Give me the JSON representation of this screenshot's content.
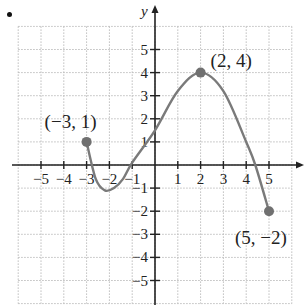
{
  "chart_data": {
    "type": "line",
    "title": "",
    "xlabel": "",
    "ylabel": "y",
    "xlim": [
      -6,
      6
    ],
    "ylim": [
      -6,
      6
    ],
    "grid": true,
    "x_ticks": [
      -5,
      -4,
      -3,
      -2,
      -1,
      1,
      2,
      3,
      4,
      5
    ],
    "x_tick_labels": [
      "−5",
      "−4",
      "−3",
      "−2",
      "−1",
      "1",
      "2",
      "3",
      "4",
      "5"
    ],
    "y_ticks": [
      5,
      4,
      3,
      2,
      1,
      -1,
      -2,
      -3,
      -4,
      -5
    ],
    "y_tick_labels": [
      "5",
      "4",
      "3",
      "2",
      "1",
      "−1",
      "−2",
      "−3",
      "−4",
      "−5"
    ],
    "series": [
      {
        "name": "f(x)",
        "x": [
          -3,
          -2.6,
          -2.2,
          -1.8,
          -1.4,
          -1,
          0,
          1,
          2,
          3,
          4,
          4.4,
          5
        ],
        "y": [
          1,
          -0.6,
          -1.1,
          -1.0,
          -0.6,
          0.1,
          1.5,
          3.2,
          4,
          3.2,
          1.0,
          0,
          -2
        ]
      }
    ],
    "annotations": [
      {
        "point": [
          -3,
          1
        ],
        "label": "(−3, 1)"
      },
      {
        "point": [
          2,
          4
        ],
        "label": "(2, 4)"
      },
      {
        "point": [
          5,
          -2
        ],
        "label": "(5, −2)"
      }
    ],
    "colors": {
      "curve": "#7a7a7a",
      "point": "#707070",
      "axis": "#222222",
      "grid": "#bdbdbd"
    }
  }
}
